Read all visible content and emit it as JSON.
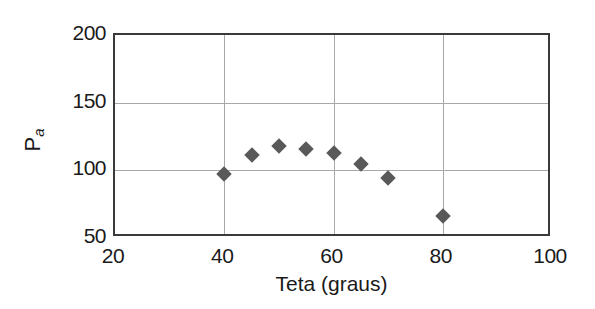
{
  "chart_data": {
    "type": "scatter",
    "title": "",
    "xlabel": "Teta (graus)",
    "ylabel": "P",
    "ylabel_subscript": "a",
    "xlim": [
      20,
      100
    ],
    "ylim": [
      50,
      200
    ],
    "xticks": [
      20,
      40,
      60,
      80,
      100
    ],
    "yticks": [
      50,
      100,
      150,
      200
    ],
    "xtick_labels": [
      "20",
      "40",
      "60",
      "80",
      "100"
    ],
    "ytick_labels": [
      "50",
      "100",
      "150",
      "200"
    ],
    "grid": {
      "horizontal_at": [
        100,
        150
      ],
      "vertical_at": [
        40,
        60,
        80
      ],
      "color": "#a8a8a8"
    },
    "marker": {
      "shape": "diamond",
      "color": "#595959",
      "size_px": 11
    },
    "frame_color": "#3a3a3a",
    "background": "#ffffff",
    "legend": null,
    "series": [
      {
        "name": "Pa vs Teta",
        "x": [
          40,
          45,
          50,
          55,
          60,
          65,
          70,
          80
        ],
        "y": [
          97,
          111,
          118,
          116,
          113,
          105,
          94,
          66
        ]
      }
    ],
    "points": [
      {
        "x": 40,
        "y": 97
      },
      {
        "x": 45,
        "y": 111
      },
      {
        "x": 50,
        "y": 118
      },
      {
        "x": 55,
        "y": 116
      },
      {
        "x": 60,
        "y": 113
      },
      {
        "x": 65,
        "y": 105
      },
      {
        "x": 70,
        "y": 94
      },
      {
        "x": 80,
        "y": 66
      }
    ]
  }
}
